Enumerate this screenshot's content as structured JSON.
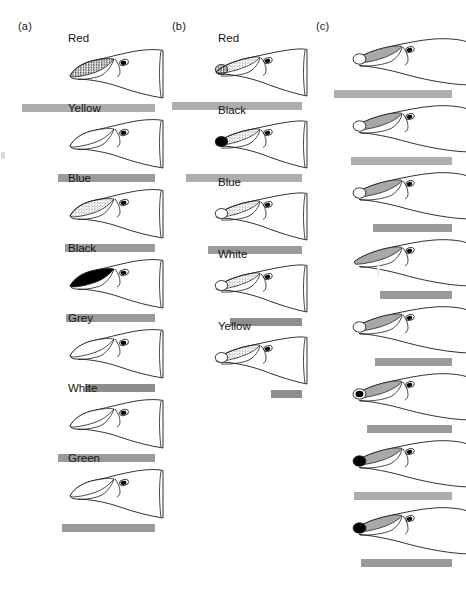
{
  "figure": {
    "panels": [
      {
        "id": "a",
        "letter": "(a)",
        "rows": [
          {
            "label": "Red",
            "snout_fill": "stipple-dark",
            "tip_spot": "none",
            "bar_value": 100
          },
          {
            "label": "Yellow",
            "snout_fill": "none",
            "tip_spot": "none",
            "bar_value": 73
          },
          {
            "label": "Blue",
            "snout_fill": "stipple-light",
            "tip_spot": "none",
            "bar_value": 68
          },
          {
            "label": "Black",
            "snout_fill": "solid-black",
            "tip_spot": "none",
            "bar_value": 67
          },
          {
            "label": "Grey",
            "snout_fill": "none",
            "tip_spot": "none",
            "bar_value": 53
          },
          {
            "label": "White",
            "snout_fill": "none",
            "tip_spot": "none",
            "bar_value": 73
          },
          {
            "label": "Green",
            "snout_fill": "none",
            "tip_spot": "none",
            "bar_value": 70
          }
        ]
      },
      {
        "id": "b",
        "letter": "(b)",
        "rows": [
          {
            "label": "Red",
            "snout_fill": "stipple-light",
            "tip_spot": "stipple",
            "bar_value": 100
          },
          {
            "label": "Black",
            "snout_fill": "stipple-light",
            "tip_spot": "black",
            "bar_value": 89
          },
          {
            "label": "Blue",
            "snout_fill": "stipple-light",
            "tip_spot": "open",
            "bar_value": 72
          },
          {
            "label": "White",
            "snout_fill": "stipple-light",
            "tip_spot": "open",
            "bar_value": 55
          },
          {
            "label": "Yellow",
            "snout_fill": "stipple-light",
            "tip_spot": "open",
            "bar_value": 24
          }
        ]
      },
      {
        "id": "c",
        "letter": "(c)",
        "rows": [
          {
            "label": "",
            "snout_fill": "grey",
            "tip_spot": "open",
            "bar_value": 100
          },
          {
            "label": "",
            "snout_fill": "grey",
            "tip_spot": "open",
            "bar_value": 86
          },
          {
            "label": "",
            "snout_fill": "grey",
            "tip_spot": "open",
            "bar_value": 67
          },
          {
            "label": "",
            "snout_fill": "grey-drip",
            "tip_spot": "none",
            "bar_value": 61
          },
          {
            "label": "",
            "snout_fill": "grey",
            "tip_spot": "open",
            "bar_value": 65
          },
          {
            "label": "",
            "snout_fill": "grey",
            "tip_spot": "ring-black",
            "bar_value": 72
          },
          {
            "label": "",
            "snout_fill": "grey",
            "tip_spot": "black",
            "bar_value": 83
          },
          {
            "label": "",
            "snout_fill": "grey",
            "tip_spot": "black",
            "bar_value": 77
          }
        ]
      }
    ],
    "colors": {
      "bar_grey": "#9e9e9e",
      "outline": "#1a1a1a",
      "snout_grey": "#a8a8a8",
      "black": "#000000"
    }
  }
}
